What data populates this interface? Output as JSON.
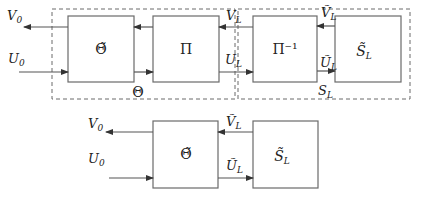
{
  "top_diagram": {
    "outer_groups": [
      {
        "id": "theta-group",
        "label": "Θ"
      },
      {
        "id": "sl-group",
        "label": "S_L"
      }
    ],
    "blocks": [
      {
        "id": "theta-tilde",
        "label": "Θ̃"
      },
      {
        "id": "pi",
        "label": "Π"
      },
      {
        "id": "pi-inverse",
        "label": "Π⁻¹"
      },
      {
        "id": "sl-tilde",
        "label": "S̃"
      }
    ],
    "signals": {
      "v0": "V",
      "v0_sub": "0",
      "u0": "U",
      "u0_sub": "0",
      "vl": "V",
      "vl_sub": "L",
      "ul": "U",
      "ul_sub": "L",
      "vl_tilde": "Ṽ",
      "vl_tilde_sub": "L",
      "ul_tilde": "Ũ",
      "ul_tilde_sub": "L"
    },
    "sl_tilde_sub": "L",
    "sl_group_base": "S",
    "sl_group_sub": "L"
  },
  "bottom_diagram": {
    "blocks": [
      {
        "id": "theta-tilde",
        "label": "Θ̃"
      },
      {
        "id": "sl-tilde",
        "label": "S̃"
      }
    ],
    "sl_tilde_sub": "L",
    "signals": {
      "v0": "V",
      "v0_sub": "0",
      "u0": "U",
      "u0_sub": "0",
      "vl_tilde": "Ṽ",
      "vl_tilde_sub": "L",
      "ul_tilde": "Ũ",
      "ul_tilde_sub": "L"
    }
  }
}
